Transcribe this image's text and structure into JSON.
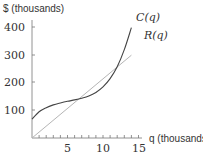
{
  "chart_data": {
    "type": "line",
    "title": "",
    "xlabel": "q (thousands)",
    "ylabel": "$ (thousands)",
    "xlim": [
      0,
      15
    ],
    "ylim": [
      0,
      420
    ],
    "grid": false,
    "legend": "inline labels at curve ends",
    "x_ticks": [
      5,
      10,
      15
    ],
    "x_minor_ticks_step": 1,
    "y_ticks": [
      100,
      200,
      300,
      400
    ],
    "series": [
      {
        "name": "C(q)",
        "color": "#444444",
        "x": [
          0,
          1,
          2,
          3,
          4,
          5,
          6,
          7,
          8,
          9,
          10,
          11,
          12,
          13,
          14
        ],
        "values": [
          68,
          95,
          110,
          120,
          127,
          133,
          138,
          144,
          152,
          165,
          185,
          215,
          258,
          320,
          400
        ]
      },
      {
        "name": "R(q)",
        "color": "#aaaaaa",
        "x": [
          0,
          14
        ],
        "values": [
          0,
          300
        ]
      }
    ],
    "annotations": [
      {
        "text": "C(q)",
        "x": 14.1,
        "y": 410
      },
      {
        "text": "R(q)",
        "x": 15,
        "y": 340
      }
    ]
  },
  "labels": {
    "y_axis": "$ (thousands)",
    "x_axis": "q (thousands)",
    "y_ticks": [
      "400",
      "300",
      "200",
      "100"
    ],
    "x_ticks": [
      "5",
      "10",
      "15"
    ],
    "c_label": "C(q)",
    "r_label": "R(q)"
  }
}
